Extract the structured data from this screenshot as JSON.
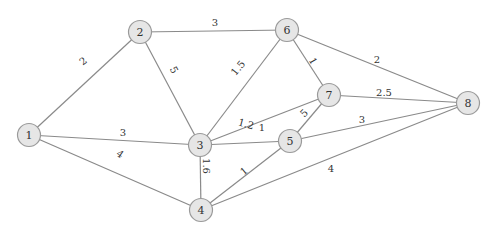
{
  "diagram": {
    "type": "weighted-undirected-graph",
    "colors": {
      "node_fill": "#e6e6e6",
      "node_stroke": "#9a9a9a",
      "edge": "#8a8a8a",
      "text": "#333333"
    },
    "nodes": [
      {
        "id": "1",
        "label": "1",
        "x": 29,
        "y": 135
      },
      {
        "id": "2",
        "label": "2",
        "x": 140,
        "y": 32
      },
      {
        "id": "3",
        "label": "3",
        "x": 200,
        "y": 145
      },
      {
        "id": "4",
        "label": "4",
        "x": 201,
        "y": 210
      },
      {
        "id": "5",
        "label": "5",
        "x": 290,
        "y": 141
      },
      {
        "id": "6",
        "label": "6",
        "x": 287,
        "y": 30
      },
      {
        "id": "7",
        "label": "7",
        "x": 329,
        "y": 95
      },
      {
        "id": "8",
        "label": "8",
        "x": 468,
        "y": 103
      }
    ],
    "edges": [
      {
        "from": "1",
        "to": "2",
        "weight": "2",
        "lx": 83,
        "ly": 61,
        "rot": -38
      },
      {
        "from": "1",
        "to": "3",
        "weight": "3",
        "lx": 123,
        "ly": 132,
        "rot": 0
      },
      {
        "from": "1",
        "to": "4",
        "weight": "4",
        "lx": 120,
        "ly": 154,
        "rot": 35
      },
      {
        "from": "2",
        "to": "6",
        "weight": "3",
        "lx": 215,
        "ly": 22,
        "rot": 0
      },
      {
        "from": "2",
        "to": "3",
        "weight": "5",
        "lx": 174,
        "ly": 70,
        "rot": 62
      },
      {
        "from": "6",
        "to": "3",
        "weight": "1.5",
        "lx": 238,
        "ly": 68,
        "rot": -50
      },
      {
        "from": "6",
        "to": "7",
        "weight": "1",
        "lx": 313,
        "ly": 61,
        "rot": 60
      },
      {
        "from": "6",
        "to": "8",
        "weight": "2",
        "lx": 377,
        "ly": 59,
        "rot": 0
      },
      {
        "from": "3",
        "to": "7",
        "weight": "1",
        "lx": 262,
        "ly": 127,
        "rot": 0
      },
      {
        "from": "7",
        "to": "8",
        "weight": "2.5",
        "lx": 384,
        "ly": 92,
        "rot": 0
      },
      {
        "from": "3",
        "to": "5",
        "weight": "1.2",
        "lx": 246,
        "ly": 124,
        "rot": 15
      },
      {
        "from": "7",
        "to": "5",
        "weight": "5",
        "lx": 304,
        "ly": 113,
        "rot": -45
      },
      {
        "from": "5",
        "to": "8",
        "weight": "3",
        "lx": 362,
        "ly": 119,
        "rot": 0
      },
      {
        "from": "3",
        "to": "4",
        "weight": "1.6",
        "lx": 206,
        "ly": 166,
        "rot": 90
      },
      {
        "from": "4",
        "to": "5",
        "weight": "1",
        "lx": 244,
        "ly": 171,
        "rot": -40
      },
      {
        "from": "4",
        "to": "8",
        "weight": "4",
        "lx": 331,
        "ly": 168,
        "rot": 0
      }
    ]
  }
}
